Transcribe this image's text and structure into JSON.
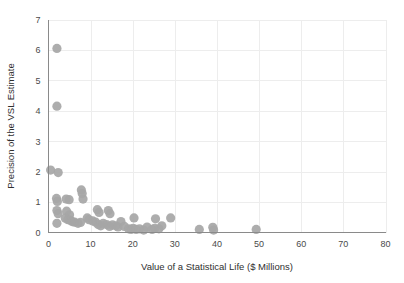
{
  "chart_data": {
    "type": "scatter",
    "title": "",
    "xlabel": "Value of a Statistical Life ($ Millions)",
    "ylabel": "Precision of the VSL Estimate",
    "xlim": [
      0,
      80
    ],
    "ylim": [
      0,
      7
    ],
    "xticks": [
      "0",
      "10",
      "20",
      "30",
      "40",
      "50",
      "60",
      "70",
      "80"
    ],
    "yticks": [
      "0",
      "1",
      "2",
      "3",
      "4",
      "5",
      "6",
      "7"
    ],
    "grid": true,
    "legend": "none",
    "marker_color": "#a6a6a6",
    "marker_size": 4.6,
    "points": [
      {
        "x": 2.0,
        "y": 6.05
      },
      {
        "x": 2.0,
        "y": 4.15
      },
      {
        "x": 0.5,
        "y": 2.05
      },
      {
        "x": 2.3,
        "y": 1.97
      },
      {
        "x": 1.9,
        "y": 1.12
      },
      {
        "x": 2.1,
        "y": 1.02
      },
      {
        "x": 4.2,
        "y": 1.1
      },
      {
        "x": 4.9,
        "y": 1.08
      },
      {
        "x": 7.8,
        "y": 1.4
      },
      {
        "x": 8.0,
        "y": 1.28
      },
      {
        "x": 8.2,
        "y": 1.1
      },
      {
        "x": 2.0,
        "y": 0.72
      },
      {
        "x": 2.3,
        "y": 0.62
      },
      {
        "x": 4.3,
        "y": 0.7
      },
      {
        "x": 5.0,
        "y": 0.58
      },
      {
        "x": 2.0,
        "y": 0.3
      },
      {
        "x": 4.0,
        "y": 0.47
      },
      {
        "x": 4.6,
        "y": 0.42
      },
      {
        "x": 5.2,
        "y": 0.4
      },
      {
        "x": 5.6,
        "y": 0.36
      },
      {
        "x": 6.2,
        "y": 0.34
      },
      {
        "x": 7.0,
        "y": 0.3
      },
      {
        "x": 7.6,
        "y": 0.33
      },
      {
        "x": 9.2,
        "y": 0.48
      },
      {
        "x": 9.6,
        "y": 0.42
      },
      {
        "x": 10.5,
        "y": 0.38
      },
      {
        "x": 11.6,
        "y": 0.75
      },
      {
        "x": 12.0,
        "y": 0.66
      },
      {
        "x": 11.2,
        "y": 0.34
      },
      {
        "x": 11.8,
        "y": 0.26
      },
      {
        "x": 12.4,
        "y": 0.22
      },
      {
        "x": 13.0,
        "y": 0.3
      },
      {
        "x": 14.2,
        "y": 0.72
      },
      {
        "x": 14.6,
        "y": 0.62
      },
      {
        "x": 13.8,
        "y": 0.26
      },
      {
        "x": 14.5,
        "y": 0.2
      },
      {
        "x": 15.2,
        "y": 0.25
      },
      {
        "x": 16.0,
        "y": 0.22
      },
      {
        "x": 16.5,
        "y": 0.18
      },
      {
        "x": 17.2,
        "y": 0.36
      },
      {
        "x": 18.0,
        "y": 0.2
      },
      {
        "x": 19.0,
        "y": 0.12
      },
      {
        "x": 19.6,
        "y": 0.1
      },
      {
        "x": 20.3,
        "y": 0.48
      },
      {
        "x": 20.1,
        "y": 0.14
      },
      {
        "x": 20.8,
        "y": 0.1
      },
      {
        "x": 21.6,
        "y": 0.12
      },
      {
        "x": 22.6,
        "y": 0.08
      },
      {
        "x": 23.4,
        "y": 0.18
      },
      {
        "x": 24.6,
        "y": 0.1
      },
      {
        "x": 25.4,
        "y": 0.45
      },
      {
        "x": 25.2,
        "y": 0.14
      },
      {
        "x": 26.2,
        "y": 0.12
      },
      {
        "x": 26.9,
        "y": 0.22
      },
      {
        "x": 29.0,
        "y": 0.48
      },
      {
        "x": 35.8,
        "y": 0.1
      },
      {
        "x": 39.0,
        "y": 0.17
      },
      {
        "x": 39.2,
        "y": 0.08
      },
      {
        "x": 49.3,
        "y": 0.1
      }
    ]
  }
}
